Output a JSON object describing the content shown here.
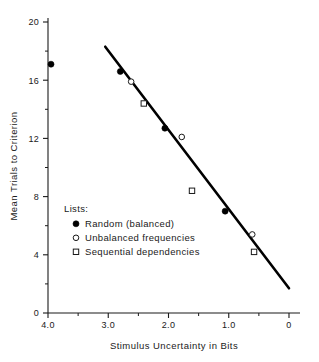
{
  "chart_data": {
    "type": "scatter",
    "title": "",
    "xlabel": "Stimulus Uncertainty in Bits",
    "ylabel": "Mean Trials to Criterion",
    "xlim": [
      4.0,
      0.0
    ],
    "ylim": [
      0,
      20
    ],
    "x_axis_reversed": true,
    "grid": false,
    "legend_position": "inside-lower-left",
    "legend_title": "Lists:",
    "x_ticks_major": [
      "4.0",
      "3.0",
      "2.0",
      "1.0",
      "0"
    ],
    "x_ticks_major_values": [
      4.0,
      3.0,
      2.0,
      1.0,
      0.0
    ],
    "x_ticks_minor_values": [
      3.5,
      2.5,
      1.5,
      0.5
    ],
    "y_ticks_major": [
      "0",
      "4",
      "8",
      "12",
      "16",
      "20"
    ],
    "y_ticks_major_values": [
      0,
      4,
      8,
      12,
      16,
      20
    ],
    "y_ticks_minor_values": [
      2,
      6,
      10,
      14,
      18
    ],
    "series": [
      {
        "name": "Random (balanced)",
        "marker": "filled-circle",
        "points": [
          {
            "x": 3.95,
            "y": 17.1
          },
          {
            "x": 2.8,
            "y": 16.6
          },
          {
            "x": 2.06,
            "y": 12.7
          },
          {
            "x": 1.06,
            "y": 7.0
          }
        ]
      },
      {
        "name": "Unbalanced frequencies",
        "marker": "open-circle",
        "points": [
          {
            "x": 2.62,
            "y": 15.9
          },
          {
            "x": 1.78,
            "y": 12.1
          },
          {
            "x": 0.61,
            "y": 5.4
          }
        ]
      },
      {
        "name": "Sequential dependencies",
        "marker": "open-square",
        "points": [
          {
            "x": 2.41,
            "y": 14.4
          },
          {
            "x": 1.61,
            "y": 8.4
          },
          {
            "x": 0.58,
            "y": 4.2
          }
        ]
      }
    ],
    "fit_line": {
      "x_start": 3.05,
      "y_start": 18.3,
      "x_end": 0.0,
      "y_end": 1.7
    },
    "annotations": []
  },
  "legend": {
    "title": "Lists:",
    "entries": [
      {
        "marker": "filled-circle",
        "label": "Random (balanced)"
      },
      {
        "marker": "open-circle",
        "label": "Unbalanced frequencies"
      },
      {
        "marker": "open-square",
        "label": "Sequential dependencies"
      }
    ]
  },
  "colors": {
    "ink": "#1a1a1a",
    "line": "#000000",
    "background": "#ffffff"
  }
}
